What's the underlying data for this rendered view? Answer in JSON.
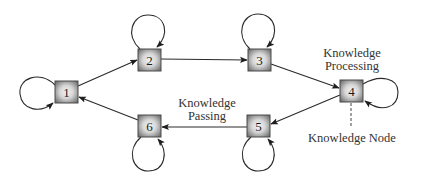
{
  "diagram": {
    "colors": {
      "background": "#ffffff",
      "stroke": "#2a2a2a",
      "node_border": "#4a4a4a",
      "node_fill_center": "#f2f2f2",
      "node_fill_edge": "#7a7a7a",
      "text": "#333333"
    },
    "nodes": [
      {
        "id": "1",
        "label": "1",
        "x": 55,
        "y": 81,
        "w": 23,
        "h": 22,
        "self_loop": "left"
      },
      {
        "id": "2",
        "label": "2",
        "x": 138,
        "y": 49,
        "w": 23,
        "h": 22,
        "self_loop": "top"
      },
      {
        "id": "3",
        "label": "3",
        "x": 248,
        "y": 49,
        "w": 23,
        "h": 22,
        "self_loop": "top"
      },
      {
        "id": "4",
        "label": "4",
        "x": 340,
        "y": 80,
        "w": 23,
        "h": 22,
        "self_loop": "right"
      },
      {
        "id": "5",
        "label": "5",
        "x": 247,
        "y": 115,
        "w": 23,
        "h": 22,
        "self_loop": "bottom"
      },
      {
        "id": "6",
        "label": "6",
        "x": 138,
        "y": 115,
        "w": 23,
        "h": 22,
        "self_loop": "bottom"
      }
    ],
    "edges": [
      {
        "from": "1",
        "to": "2"
      },
      {
        "from": "2",
        "to": "3"
      },
      {
        "from": "3",
        "to": "4"
      },
      {
        "from": "4",
        "to": "5"
      },
      {
        "from": "5",
        "to": "6"
      },
      {
        "from": "6",
        "to": "1"
      }
    ],
    "annotations": {
      "processing_line1": "Knowledge",
      "processing_line2": "Processing",
      "passing_line1": "Knowledge",
      "passing_line2": "Passing",
      "node_label": "Knowledge Node"
    }
  }
}
